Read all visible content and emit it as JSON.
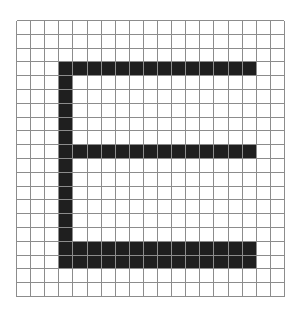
{
  "canvas": {
    "width": 298,
    "height": 314,
    "background_color": "#ffffff",
    "title": "Grid Letter E"
  },
  "grid": {
    "name": "graph-paper-grid",
    "origin_x": 16,
    "origin_y": 20,
    "columns": 19,
    "rows": 20,
    "cell_width": 14.1,
    "cell_height": 13.8,
    "line_color": "#8c8c8c",
    "line_width": 1,
    "background_color": "#ffffff"
  },
  "glyph": {
    "name": "letter-e",
    "character": "E",
    "fill_color": "#1f1f1f",
    "description": "Block capital letter E rendered by filling whole grid cells",
    "strokes": [
      {
        "name": "vertical-stem",
        "col_start": 3,
        "col_end": 4,
        "row_start": 3,
        "row_end": 18
      },
      {
        "name": "top-horizontal-bar",
        "col_start": 3,
        "col_end": 17,
        "row_start": 3,
        "row_end": 4
      },
      {
        "name": "middle-horizontal-bar",
        "col_start": 3,
        "col_end": 17,
        "row_start": 9,
        "row_end": 10
      },
      {
        "name": "bottom-horizontal-bar",
        "col_start": 3,
        "col_end": 17,
        "row_start": 16,
        "row_end": 17
      }
    ]
  },
  "chart_data": {
    "type": "heatmap",
    "title": "",
    "xlabel": "",
    "ylabel": "",
    "grid": true,
    "columns": 19,
    "rows": 20,
    "legend": [],
    "value_colors": {
      "0": "#ffffff",
      "1": "#1f1f1f"
    },
    "matrix": [
      [
        0,
        0,
        0,
        0,
        0,
        0,
        0,
        0,
        0,
        0,
        0,
        0,
        0,
        0,
        0,
        0,
        0,
        0,
        0
      ],
      [
        0,
        0,
        0,
        0,
        0,
        0,
        0,
        0,
        0,
        0,
        0,
        0,
        0,
        0,
        0,
        0,
        0,
        0,
        0
      ],
      [
        0,
        0,
        0,
        0,
        0,
        0,
        0,
        0,
        0,
        0,
        0,
        0,
        0,
        0,
        0,
        0,
        0,
        0,
        0
      ],
      [
        0,
        0,
        0,
        1,
        1,
        1,
        1,
        1,
        1,
        1,
        1,
        1,
        1,
        1,
        1,
        1,
        1,
        0,
        0
      ],
      [
        0,
        0,
        0,
        1,
        0,
        0,
        0,
        0,
        0,
        0,
        0,
        0,
        0,
        0,
        0,
        0,
        0,
        0,
        0
      ],
      [
        0,
        0,
        0,
        1,
        0,
        0,
        0,
        0,
        0,
        0,
        0,
        0,
        0,
        0,
        0,
        0,
        0,
        0,
        0
      ],
      [
        0,
        0,
        0,
        1,
        0,
        0,
        0,
        0,
        0,
        0,
        0,
        0,
        0,
        0,
        0,
        0,
        0,
        0,
        0
      ],
      [
        0,
        0,
        0,
        1,
        0,
        0,
        0,
        0,
        0,
        0,
        0,
        0,
        0,
        0,
        0,
        0,
        0,
        0,
        0
      ],
      [
        0,
        0,
        0,
        1,
        0,
        0,
        0,
        0,
        0,
        0,
        0,
        0,
        0,
        0,
        0,
        0,
        0,
        0,
        0
      ],
      [
        0,
        0,
        0,
        1,
        1,
        1,
        1,
        1,
        1,
        1,
        1,
        1,
        1,
        1,
        1,
        1,
        1,
        0,
        0
      ],
      [
        0,
        0,
        0,
        1,
        0,
        0,
        0,
        0,
        0,
        0,
        0,
        0,
        0,
        0,
        0,
        0,
        0,
        0,
        0
      ],
      [
        0,
        0,
        0,
        1,
        0,
        0,
        0,
        0,
        0,
        0,
        0,
        0,
        0,
        0,
        0,
        0,
        0,
        0,
        0
      ],
      [
        0,
        0,
        0,
        1,
        0,
        0,
        0,
        0,
        0,
        0,
        0,
        0,
        0,
        0,
        0,
        0,
        0,
        0,
        0
      ],
      [
        0,
        0,
        0,
        1,
        0,
        0,
        0,
        0,
        0,
        0,
        0,
        0,
        0,
        0,
        0,
        0,
        0,
        0,
        0
      ],
      [
        0,
        0,
        0,
        1,
        0,
        0,
        0,
        0,
        0,
        0,
        0,
        0,
        0,
        0,
        0,
        0,
        0,
        0,
        0
      ],
      [
        0,
        0,
        0,
        1,
        0,
        0,
        0,
        0,
        0,
        0,
        0,
        0,
        0,
        0,
        0,
        0,
        0,
        0,
        0
      ],
      [
        0,
        0,
        0,
        1,
        1,
        1,
        1,
        1,
        1,
        1,
        1,
        1,
        1,
        1,
        1,
        1,
        1,
        0,
        0
      ],
      [
        0,
        0,
        0,
        1,
        1,
        1,
        1,
        1,
        1,
        1,
        1,
        1,
        1,
        1,
        1,
        1,
        1,
        0,
        0
      ],
      [
        0,
        0,
        0,
        0,
        0,
        0,
        0,
        0,
        0,
        0,
        0,
        0,
        0,
        0,
        0,
        0,
        0,
        0,
        0
      ],
      [
        0,
        0,
        0,
        0,
        0,
        0,
        0,
        0,
        0,
        0,
        0,
        0,
        0,
        0,
        0,
        0,
        0,
        0,
        0
      ]
    ]
  }
}
